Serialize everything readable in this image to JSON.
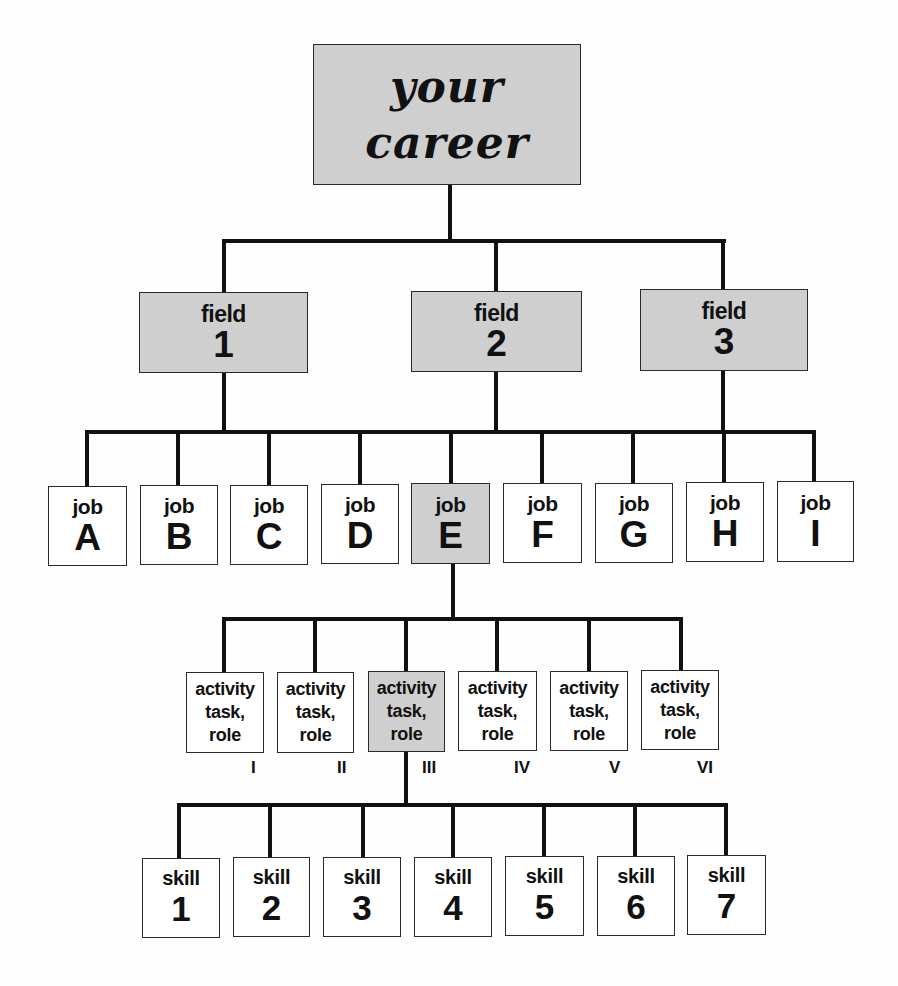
{
  "diagram": {
    "type": "hierarchy-tree",
    "colors": {
      "line": "#111111",
      "border": "#2a2a2a",
      "shaded_fill": "#cfcfcf",
      "plain_fill": "#ffffff"
    },
    "root": {
      "line1": "your",
      "line2": "career",
      "shaded": true
    },
    "fields": [
      {
        "kind": "field",
        "id": "1",
        "shaded": true
      },
      {
        "kind": "field",
        "id": "2",
        "shaded": true
      },
      {
        "kind": "field",
        "id": "3",
        "shaded": true
      }
    ],
    "jobs": [
      {
        "kind": "job",
        "id": "A",
        "field": "1",
        "shaded": false
      },
      {
        "kind": "job",
        "id": "B",
        "field": "1",
        "shaded": false
      },
      {
        "kind": "job",
        "id": "C",
        "field": "1",
        "shaded": false
      },
      {
        "kind": "job",
        "id": "D",
        "field": "2",
        "shaded": false
      },
      {
        "kind": "job",
        "id": "E",
        "field": "2",
        "shaded": true
      },
      {
        "kind": "job",
        "id": "F",
        "field": "2",
        "shaded": false
      },
      {
        "kind": "job",
        "id": "G",
        "field": "3",
        "shaded": false
      },
      {
        "kind": "job",
        "id": "H",
        "field": "3",
        "shaded": false
      },
      {
        "kind": "job",
        "id": "I",
        "field": "3",
        "shaded": false
      }
    ],
    "activities": [
      {
        "line1": "activity",
        "line2": "task,",
        "line3": "role",
        "numeral": "I",
        "shaded": false
      },
      {
        "line1": "activity",
        "line2": "task,",
        "line3": "role",
        "numeral": "II",
        "shaded": false
      },
      {
        "line1": "activity",
        "line2": "task,",
        "line3": "role",
        "numeral": "III",
        "shaded": true
      },
      {
        "line1": "activity",
        "line2": "task,",
        "line3": "role",
        "numeral": "IV",
        "shaded": false
      },
      {
        "line1": "activity",
        "line2": "task,",
        "line3": "role",
        "numeral": "V",
        "shaded": false
      },
      {
        "line1": "activity",
        "line2": "task,",
        "line3": "role",
        "numeral": "VI",
        "shaded": false
      }
    ],
    "skills": [
      {
        "kind": "skill",
        "id": "1"
      },
      {
        "kind": "skill",
        "id": "2"
      },
      {
        "kind": "skill",
        "id": "3"
      },
      {
        "kind": "skill",
        "id": "4"
      },
      {
        "kind": "skill",
        "id": "5"
      },
      {
        "kind": "skill",
        "id": "6"
      },
      {
        "kind": "skill",
        "id": "7"
      }
    ]
  }
}
